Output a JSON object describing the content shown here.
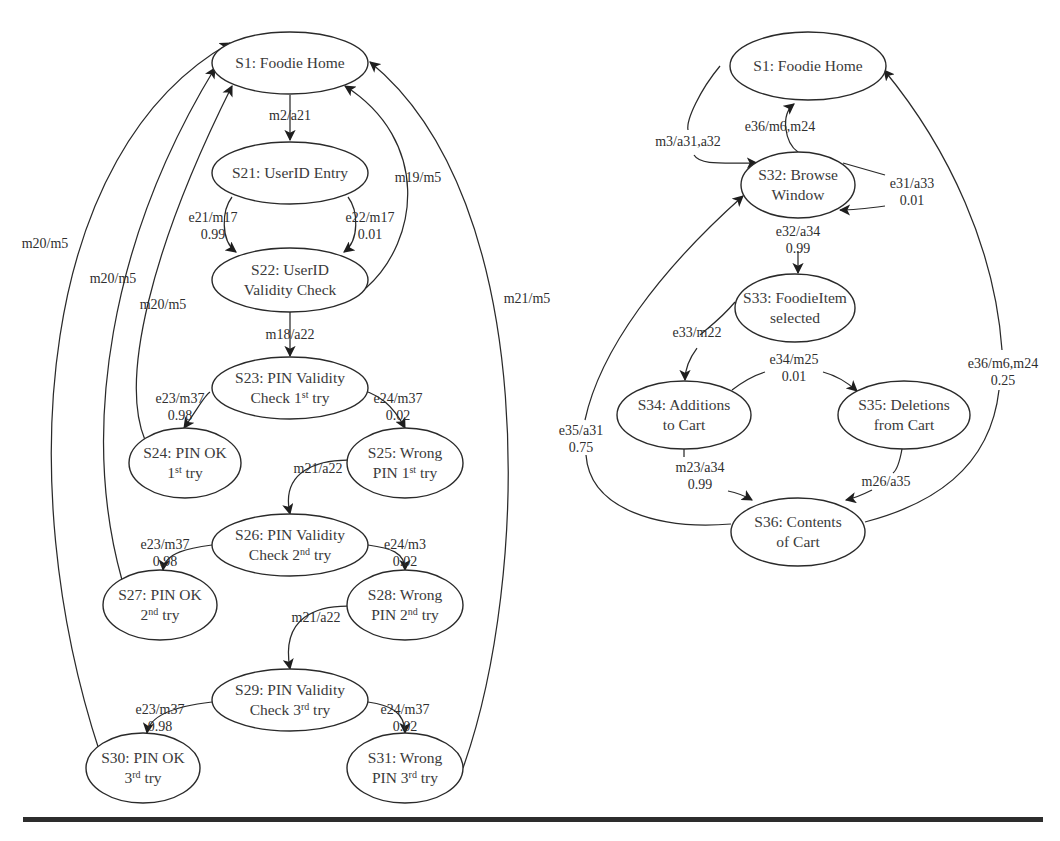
{
  "diagram_left": {
    "title": "Login / PIN validation state machine",
    "nodes": [
      {
        "id": "S1",
        "lines": [
          "S1: Foodie Home"
        ],
        "cx": 290,
        "cy": 63,
        "rx": 78,
        "ry": 31
      },
      {
        "id": "S21",
        "lines": [
          "S21: UserID Entry"
        ],
        "cx": 290,
        "cy": 173,
        "rx": 78,
        "ry": 31
      },
      {
        "id": "S22",
        "lines": [
          "S22: UserID",
          "Validity Check"
        ],
        "cx": 290,
        "cy": 280,
        "rx": 78,
        "ry": 32
      },
      {
        "id": "S23",
        "lines": [
          "S23: PIN Validity",
          "Check 1|st| try"
        ],
        "cx": 290,
        "cy": 388,
        "rx": 78,
        "ry": 31
      },
      {
        "id": "S24",
        "lines": [
          "S24: PIN OK",
          "1|st| try"
        ],
        "cx": 185,
        "cy": 463,
        "rx": 56,
        "ry": 35
      },
      {
        "id": "S25",
        "lines": [
          "S25: Wrong",
          "PIN 1|st| try"
        ],
        "cx": 405,
        "cy": 463,
        "rx": 58,
        "ry": 35
      },
      {
        "id": "S26",
        "lines": [
          "S26: PIN Validity",
          "Check 2|nd| try"
        ],
        "cx": 290,
        "cy": 545,
        "rx": 78,
        "ry": 31
      },
      {
        "id": "S27",
        "lines": [
          "S27: PIN OK",
          "2|nd| try"
        ],
        "cx": 160,
        "cy": 605,
        "rx": 57,
        "ry": 35
      },
      {
        "id": "S28",
        "lines": [
          "S28: Wrong",
          "PIN 2|nd| try"
        ],
        "cx": 405,
        "cy": 605,
        "rx": 58,
        "ry": 35
      },
      {
        "id": "S29",
        "lines": [
          "S29: PIN Validity",
          "Check 3|rd| try"
        ],
        "cx": 290,
        "cy": 700,
        "rx": 78,
        "ry": 31
      },
      {
        "id": "S30",
        "lines": [
          "S30: PIN OK",
          "3|rd| try"
        ],
        "cx": 143,
        "cy": 768,
        "rx": 57,
        "ry": 35
      },
      {
        "id": "S31",
        "lines": [
          "S31: Wrong",
          "PIN 3|rd| try"
        ],
        "cx": 405,
        "cy": 768,
        "rx": 58,
        "ry": 35
      }
    ],
    "edges": [
      {
        "from": "S1",
        "to": "S21",
        "label": [
          "m2/a21"
        ],
        "d": "M290 95 L290 140",
        "lx": 290,
        "ly": 120
      },
      {
        "from": "S21",
        "to": "S22",
        "label": [
          "e21/m17",
          "0.99"
        ],
        "d": "M232 197 C222 210 220 240 236 252",
        "lx": 213,
        "ly": 222
      },
      {
        "from": "S21",
        "to": "S22",
        "label": [
          "e22/m17",
          "0.01"
        ],
        "d": "M348 197 C358 210 360 240 344 252",
        "lx": 370,
        "ly": 222
      },
      {
        "from": "S22",
        "to": "S1",
        "label": [
          "m19/m5"
        ],
        "d": "M366 288 C420 240 430 140 345 86",
        "lx": 418,
        "ly": 182
      },
      {
        "from": "S22",
        "to": "S23",
        "label": [
          "m18/a22"
        ],
        "d": "M290 312 L290 356",
        "lx": 290,
        "ly": 339
      },
      {
        "from": "S23",
        "to": "S24",
        "label": [
          "e23/m37",
          "0.98"
        ],
        "d": "M210 392 C205 395 200 405 184 428",
        "lx": 180,
        "ly": 403
      },
      {
        "from": "S23",
        "to": "S25",
        "label": [
          "e24/m37",
          "0.02"
        ],
        "d": "M368 392 C375 395 390 400 405 428",
        "lx": 398,
        "ly": 403
      },
      {
        "from": "S24",
        "to": "S1",
        "label": [
          "m20/m5"
        ],
        "d": "M145 440 C120 380 150 250 232 86",
        "lx": 163,
        "ly": 309
      },
      {
        "from": "S25",
        "to": "S26",
        "label": [
          "m21/a22"
        ],
        "d": "M347 460 C320 460 280 470 290 514",
        "lx": 318,
        "ly": 473
      },
      {
        "from": "S26",
        "to": "S27",
        "label": [
          "e23/m37",
          "0.98"
        ],
        "d": "M212 545 C190 548 165 552 163 570",
        "lx": 165,
        "ly": 549
      },
      {
        "from": "S26",
        "to": "S28",
        "label": [
          "e24/m3",
          "0.02"
        ],
        "d": "M368 545 C390 548 405 552 405 570",
        "lx": 405,
        "ly": 549
      },
      {
        "from": "S27",
        "to": "S1",
        "label": [
          "m20/m5"
        ],
        "d": "M122 580 C80 430 110 240 215 68",
        "lx": 113,
        "ly": 283
      },
      {
        "from": "S28",
        "to": "S29",
        "label": [
          "m21/a22"
        ],
        "d": "M347 606 C320 606 280 615 290 669",
        "lx": 316,
        "ly": 622
      },
      {
        "from": "S29",
        "to": "S30",
        "label": [
          "e23/m37",
          "0.98"
        ],
        "d": "M212 702 C185 705 150 712 147 733",
        "lx": 160,
        "ly": 714
      },
      {
        "from": "S29",
        "to": "S31",
        "label": [
          "e24/m37",
          "0.02"
        ],
        "d": "M368 702 C390 705 405 712 405 733",
        "lx": 405,
        "ly": 714
      },
      {
        "from": "S30",
        "to": "S1",
        "label": [
          "m20/m5"
        ],
        "d": "M100 753 C10 480 40 150 230 43",
        "lx": 45,
        "ly": 248
      },
      {
        "from": "S31",
        "to": "S1",
        "label": [
          "m21/m5"
        ],
        "d": "M463 768 C530 580 540 200 370 62",
        "lx": 527,
        "ly": 303
      }
    ]
  },
  "diagram_right": {
    "title": "Browse / cart state machine",
    "nodes": [
      {
        "id": "S1",
        "lines": [
          "S1: Foodie Home"
        ],
        "cx": 808,
        "cy": 66,
        "rx": 78,
        "ry": 34
      },
      {
        "id": "S32",
        "lines": [
          "S32: Browse",
          "Window"
        ],
        "cx": 798,
        "cy": 185,
        "rx": 57,
        "ry": 33
      },
      {
        "id": "S33",
        "lines": [
          "S33: FoodieItem",
          "selected"
        ],
        "cx": 795,
        "cy": 308,
        "rx": 60,
        "ry": 34
      },
      {
        "id": "S34",
        "lines": [
          "S34: Additions",
          "to Cart"
        ],
        "cx": 684,
        "cy": 415,
        "rx": 67,
        "ry": 34
      },
      {
        "id": "S35",
        "lines": [
          "S35: Deletions",
          "from Cart"
        ],
        "cx": 904,
        "cy": 415,
        "rx": 66,
        "ry": 34
      },
      {
        "id": "S36",
        "lines": [
          "S36: Contents",
          "of Cart"
        ],
        "cx": 798,
        "cy": 532,
        "rx": 67,
        "ry": 34
      }
    ],
    "edges": [
      {
        "from": "S1",
        "to": "S32",
        "label": [
          "m3/a31,a32"
        ],
        "d": "M720 66 C700 90 686 120 688 130",
        "lx": 688,
        "ly": 146
      },
      {
        "from": "S1",
        "to": "S32",
        "label": [],
        "d": "M694 155 C700 165 720 163 757 163",
        "lx": 0,
        "ly": 0
      },
      {
        "from": "S32",
        "to": "S1",
        "label": [
          "e36/m6,m24"
        ],
        "d": "M798 152 C785 143 780 115 794 104",
        "lx": 780,
        "ly": 131
      },
      {
        "from": "S32",
        "to": "S32",
        "label": [
          "e31/a33",
          "0.01"
        ],
        "d": "M885 175 L843 163",
        "lx": 912,
        "ly": 188
      },
      {
        "from": "S32",
        "to": "S32",
        "label": [],
        "d": "M885 206 C870 208 855 210 840 210",
        "lx": 0,
        "ly": 0
      },
      {
        "from": "S32",
        "to": "S33",
        "label": [
          "e32/a34",
          "0.99"
        ],
        "d": "M798 251 L798 273",
        "lx": 798,
        "ly": 236
      },
      {
        "from": "S33",
        "to": "S34",
        "label": [
          "e33/m22"
        ],
        "d": "M735 302 C720 320 705 330 700 335",
        "lx": 697,
        "ly": 337
      },
      {
        "from": "S33",
        "to": "S34",
        "label": [],
        "d": "M697 348 C688 360 685 370 685 380",
        "lx": 0,
        "ly": 0
      },
      {
        "from": "S34",
        "to": "S35",
        "label": [
          "e34/m25",
          "0.01"
        ],
        "d": "M732 390 C745 380 755 375 765 372",
        "lx": 794,
        "ly": 364
      },
      {
        "from": "S34",
        "to": "S35",
        "label": [],
        "d": "M823 372 C838 376 848 383 857 391",
        "lx": 0,
        "ly": 0
      },
      {
        "from": "S34",
        "to": "S36",
        "label": [
          "m23/a34",
          "0.99"
        ],
        "d": "M684 449 L684 457",
        "lx": 700,
        "ly": 472
      },
      {
        "from": "S34",
        "to": "S36",
        "label": [],
        "d": "M728 491 C738 493 745 496 752 500",
        "lx": 0,
        "ly": 0
      },
      {
        "from": "S35",
        "to": "S36",
        "label": [
          "m26/a35"
        ],
        "d": "M902 449 C900 460 897 470 893 473",
        "lx": 886,
        "ly": 486
      },
      {
        "from": "S35",
        "to": "S36",
        "label": [],
        "d": "M872 490 C862 495 855 498 846 500",
        "lx": 0,
        "ly": 0
      },
      {
        "from": "S36",
        "to": "S32",
        "label": [
          "e35/a31",
          "0.75"
        ],
        "d": "M731 524 C660 530 590 510 586 455",
        "lx": 581,
        "ly": 435
      },
      {
        "from": "S36",
        "to": "S32",
        "label": [],
        "d": "M585 420 C600 350 660 270 743 196",
        "lx": 0,
        "ly": 0
      },
      {
        "from": "S36",
        "to": "S1",
        "label": [
          "e36/m6,m24",
          "0.25"
        ],
        "d": "M865 522 C930 505 990 470 999 390",
        "lx": 1003,
        "ly": 368
      },
      {
        "from": "S36",
        "to": "S1",
        "label": [],
        "d": "M1002 350 C995 250 950 150 884 70",
        "lx": 0,
        "ly": 0
      }
    ]
  },
  "rule": {
    "x": 23,
    "y": 817,
    "width": 1020,
    "height": 5
  }
}
